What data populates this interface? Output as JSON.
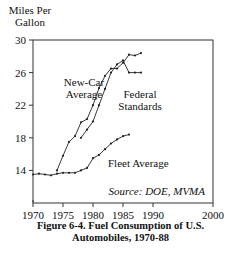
{
  "chart_data": {
    "type": "line",
    "title": "Figure 6-4. Fuel Consumption of U.S. Automobiles, 1970-88",
    "caption_lines": [
      "Figure 6-4. Fuel Consumption of U.S.",
      "Automobiles, 1970-88"
    ],
    "xlabel": "",
    "ylabel": "Miles Per Gallon",
    "ylabel_lines": [
      "Miles Per",
      "Gallon"
    ],
    "xlim": [
      1970,
      2000
    ],
    "ylim": [
      10,
      30
    ],
    "xticks": [
      1970,
      1975,
      1980,
      1985,
      1990,
      2000
    ],
    "xtick_labels": [
      "1970",
      "1975",
      "1980",
      "1985",
      "1990",
      "2000"
    ],
    "yticks": [
      14,
      18,
      22,
      26,
      30
    ],
    "ytick_labels": [
      "14",
      "18",
      "22",
      "26",
      "30"
    ],
    "grid": false,
    "legend": "none (series labeled directly on plot)",
    "annotation": "Source: DOE, MVMA",
    "data_note": "Values are estimated by reading pixel positions off a low-resolution (241x259) scan. The axis scale is about 8.2 px per mpg and 6 px per year, and each point could only be located to within about 1 px, so individual values carry an uncertainty of roughly +/-0.15 mpg and +/-0.2 years. Treat them as approximate readings, not source data.",
    "series": [
      {
        "name": "New-Car Average",
        "label_lines": [
          "New-Car",
          "Average"
        ],
        "x": [
          1974,
          1975,
          1976,
          1977,
          1978,
          1979,
          1980,
          1981,
          1982,
          1983,
          1984,
          1985,
          1986,
          1987,
          1988
        ],
        "values": [
          14.0,
          15.8,
          17.5,
          18.2,
          19.9,
          20.3,
          22.0,
          24.1,
          25.6,
          26.5,
          26.5,
          27.2,
          28.2,
          28.1,
          28.4
        ],
        "confidence": "Endpoints and the 1980-81 and 1985-88 regions could be read directly. Some intermediate points were hard to tell apart from the Federal Standards line and were estimated by interpolation."
      },
      {
        "name": "Federal Standards",
        "label_lines": [
          "Federal",
          "Standards"
        ],
        "x": [
          1978,
          1979,
          1980,
          1981,
          1982,
          1983,
          1984,
          1985,
          1986,
          1987,
          1988
        ],
        "values": [
          18.0,
          19.0,
          20.0,
          22.0,
          24.0,
          26.0,
          27.0,
          27.5,
          26.0,
          26.0,
          26.0
        ],
        "confidence": "The 1978 start point and the flat 1986-88 segment could be read. The 1979-85 values are interpolated along a line that mostly overlaps the New-Car series, so those values are more uncertain."
      },
      {
        "name": "Fleet Average",
        "label_lines": [
          "Fleet Average"
        ],
        "x": [
          1970,
          1971,
          1972,
          1973,
          1974,
          1975,
          1976,
          1977,
          1978,
          1979,
          1980,
          1981,
          1982,
          1983,
          1984,
          1985,
          1986
        ],
        "values": [
          13.5,
          13.6,
          13.5,
          13.4,
          13.6,
          13.7,
          13.7,
          13.7,
          14.0,
          14.3,
          15.5,
          15.9,
          16.6,
          17.3,
          17.8,
          18.2,
          18.4
        ],
        "confidence": "The flat 1970-77 segment and the 1986 endpoint could be read directly. Several middle markers were not individually distinguishable, so some values were interpolated from a smooth trend."
      }
    ],
    "stray_marker": {
      "x": 1970,
      "y": 10.2,
      "note": "Small unlabeled mark near the origin. Its meaning is unclear and it may be a scanning artifact."
    }
  }
}
